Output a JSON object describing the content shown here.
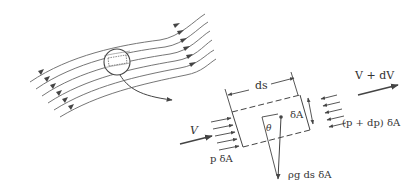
{
  "diagram": {
    "type": "fluid-element-on-streamline",
    "colors": {
      "line": "#555555",
      "text": "#333333",
      "background": "#ffffff"
    },
    "streamlines": {
      "count": 6,
      "arrow_direction": "left-to-right"
    },
    "magnifier": {
      "shape": "circle",
      "contains": "small dashed fluid element"
    },
    "labels": {
      "ds": "ds",
      "dA": "δA",
      "theta": "θ",
      "V_in": "V",
      "V_out": "V + dV",
      "p_in": "p δA",
      "p_out": "(p + dp) δA",
      "weight": "ρg ds δA"
    }
  }
}
